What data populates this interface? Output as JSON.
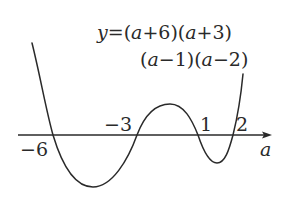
{
  "diagram": {
    "equation": {
      "line1": "y=(a+6)(a+3)",
      "line2": "(a−1)(a−2)",
      "line1_parts": [
        "y",
        "=(",
        "a",
        "+6)(",
        "a",
        "+3)"
      ],
      "line2_parts": [
        "(",
        "a",
        "−1)(",
        "a",
        "−2)"
      ]
    },
    "axis": {
      "label": "a"
    },
    "roots": [
      {
        "value": -6,
        "label": "−6"
      },
      {
        "value": -3,
        "label": "−3"
      },
      {
        "value": 1,
        "label": "1"
      },
      {
        "value": 2,
        "label": "2"
      }
    ],
    "curve": {
      "description": "Quartic curve crossing axis at -6, -3, 1, 2; minimum between -6 and -3, local maximum between -3 and 1, local minimum between 1 and 2",
      "stroke": "#2a2a2a"
    },
    "colors": {
      "background": "#ffffff",
      "ink": "#2a2a2a"
    }
  }
}
